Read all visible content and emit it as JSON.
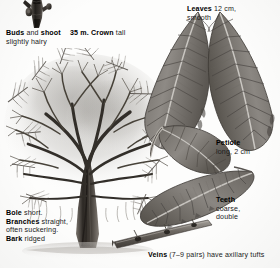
{
  "plate": {
    "subject": "elm-tree-field-guide-plate",
    "background_color": "#fdfdfc",
    "ink_color": "#111111"
  },
  "labels": {
    "buds": {
      "name": "buds-and-shoot-label",
      "lines": [
        [
          {
            "t": "Buds",
            "w": "bold"
          },
          {
            "t": " and ",
            "w": "light"
          },
          {
            "t": "shoot",
            "w": "bold"
          }
        ],
        [
          {
            "t": "slightly hairy",
            "w": "light"
          }
        ]
      ]
    },
    "crown": {
      "name": "crown-height-label",
      "lines": [
        [
          {
            "t": "35 m. ",
            "w": "bold"
          },
          {
            "t": "Crown",
            "w": "bold"
          },
          {
            "t": " tall",
            "w": "light"
          }
        ]
      ]
    },
    "leaves": {
      "name": "leaves-label",
      "lines": [
        [
          {
            "t": "Leaves",
            "w": "bold"
          },
          {
            "t": " 12 cm,",
            "w": "light"
          }
        ],
        [
          {
            "t": "smooth",
            "w": "light"
          }
        ]
      ]
    },
    "petiole": {
      "name": "petiole-label",
      "lines": [
        [
          {
            "t": "Petiole",
            "w": "bold"
          }
        ],
        [
          {
            "t": "long, 2 cm",
            "w": "light"
          }
        ]
      ]
    },
    "teeth": {
      "name": "teeth-label",
      "lines": [
        [
          {
            "t": "Teeth",
            "w": "bold"
          }
        ],
        [
          {
            "t": "coarse,",
            "w": "light"
          }
        ],
        [
          {
            "t": "double",
            "w": "light"
          }
        ]
      ]
    },
    "bole": {
      "name": "bole-branches-bark-label",
      "lines": [
        [
          {
            "t": "Bole",
            "w": "bold"
          },
          {
            "t": " short.",
            "w": "light"
          }
        ],
        [
          {
            "t": "Branches",
            "w": "bold"
          },
          {
            "t": " straight,",
            "w": "light"
          }
        ],
        [
          {
            "t": "often suckering.",
            "w": "light"
          }
        ],
        [
          {
            "t": "Bark",
            "w": "bold"
          },
          {
            "t": " ridged",
            "w": "light"
          }
        ]
      ]
    },
    "veins": {
      "name": "veins-label",
      "lines": [
        [
          {
            "t": "Veins",
            "w": "bold"
          },
          {
            "t": " (7–9 pairs) have axillary tufts",
            "w": "light"
          }
        ]
      ]
    }
  },
  "figures": {
    "shoot": "bud-and-shoot-photo",
    "tree": "bare-winter-tree-habit-photo",
    "leaf_upper_left": "leaf-blade-photo",
    "leaf_upper_right": "leaf-blade-photo",
    "leaf_mid": "leaf-with-petiole-photo",
    "leaf_lower": "leaf-underside-photo",
    "twig": "leafy-twig-photo"
  }
}
